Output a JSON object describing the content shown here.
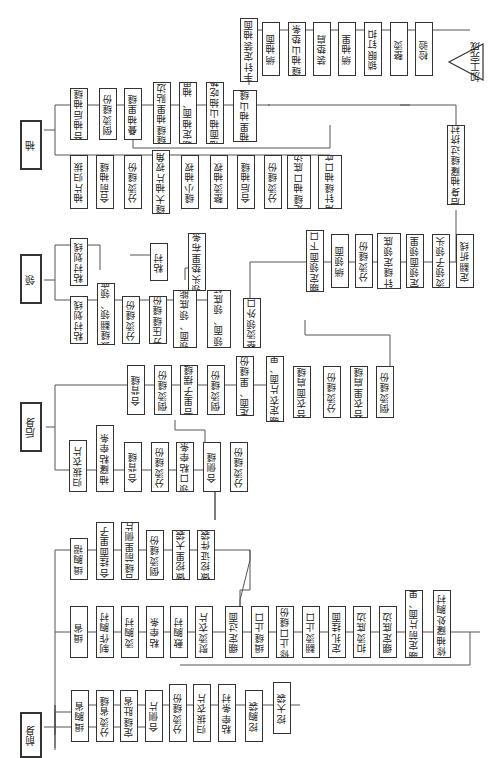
{
  "sections": {
    "front": {
      "label": "前身",
      "branch_a": [
        "缉胸省",
        "分烫省缝",
        "定缝肚省",
        "合侧片",
        "分烫缝份",
        "归拔衣片",
        "粘牵条衬",
        "挖胸袋",
        "挖大袋"
      ],
      "branch_b": [
        "缉省",
        "制作胸衬",
        "烫胸衬",
        "粘牵条",
        "敷胸衬",
        "熨烫衣片",
        "绷定过面",
        "缉缝止口",
        "修止口缝份",
        "翻烫止口",
        "定扎挂面",
        "扣烫底边",
        "绷定底边",
        "绷定前片面、里",
        "修袖窿处胸衬"
      ],
      "branch_c": [
        "缉胸褶",
        "合挂面里子",
        "合缝前里侧片",
        "倒烫缝份",
        "做挖里大袋",
        "做挖证件袋"
      ]
    },
    "back": {
      "label": "后身",
      "branch_a": [
        "归拔衣片",
        "袖窿粘牵条",
        "合背缝",
        "分烫缝份",
        "领口粘牵条",
        "合侧缝",
        "分烫缝份"
      ],
      "branch_b": [
        "合背缝",
        "倒烫缝份",
        "合里子摆缝",
        "倒烫缝份",
        "定面、里缝份",
        "绷定衣片面、里",
        "合衣面肩缝",
        "分烫缝份",
        "合衣里肩缝",
        "倒烫缝份"
      ]
    },
    "collar": {
      "label": "领",
      "branch_a": [
        "粘衬划线",
        "拔缝翻领、领座",
        "分烫缝份",
        "分压缝缝份",
        "拼缝领面、领底能外口",
        "合缝领面、领底领头",
        "整烫领外口"
      ],
      "branch_b": [
        "粘衬划线"
      ],
      "branch_c": [
        "粘衬",
        "领头垫里布条"
      ],
      "branch_d": [
        "绷定领面下口",
        "绱领面",
        "分烫缝份",
        "三角针缝定领底下口",
        "定领面领里",
        "烫领子领头",
        "定翻折线"
      ]
    },
    "sleeve": {
      "label": "袖",
      "branch_a": [
        "袖片归拔",
        "合前袖缝",
        "分烫缝份",
        "缝大袖片衩角",
        "缝小袖衩",
        "整烫袖衩",
        "合后袖缝",
        "分烫缝份",
        "定缝袖口底边",
        "三角针缝袖口底边"
      ],
      "branch_b": [
        "合袖后袖缝",
        "倒烫缝份",
        "叠袖里缝",
        "缝缝袖里贴边",
        "绷定袖面、袖里",
        "袖面袖山抽吃势",
        "烫袖里袖山缝份"
      ]
    },
    "assembly": [
      "后身袖窿缝过挤衬",
      "手针定装袖面",
      "绱袖面",
      "缝袖山垫条",
      "装垫肩",
      "绱袖里",
      "锁眼钉扣",
      "整烫",
      "检验"
    ],
    "end": "加工完成"
  }
}
